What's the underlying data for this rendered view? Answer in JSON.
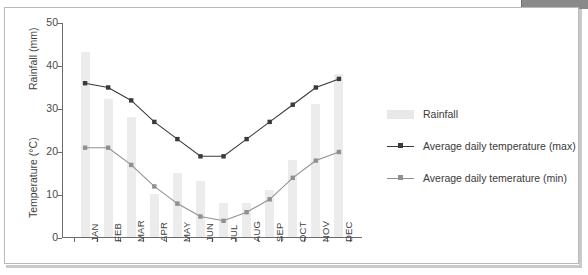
{
  "chart_data": {
    "type": "bar",
    "title": "",
    "subtitle": "",
    "xlabel": "",
    "ylabel": "Rainfall (mm)",
    "ylabel2": "Temperature (°C)",
    "ylim": [
      0,
      50
    ],
    "ytick_values": [
      0,
      10,
      20,
      30,
      40,
      50
    ],
    "ytick_labels": [
      "0",
      "10",
      "20",
      "30",
      "40",
      "50"
    ],
    "grid": false,
    "legend_position": "right",
    "categories": [
      "JAN",
      "FEB",
      "MAR",
      "APR",
      "MAY",
      "JUN",
      "JUL",
      "AUG",
      "SEP",
      "OCT",
      "NOV",
      "DEC"
    ],
    "series": [
      {
        "name": "Rainfall",
        "type": "bar",
        "color": "#ececec",
        "unit": "mm",
        "values": [
          43,
          32,
          28,
          10,
          15,
          13,
          8,
          8,
          11,
          18,
          31,
          38
        ]
      },
      {
        "name": "Average daily temperature (max)",
        "type": "line",
        "color": "#3a3a3a",
        "unit": "°C",
        "values": [
          36,
          35,
          32,
          27,
          23,
          19,
          19,
          23,
          27,
          31,
          35,
          37
        ]
      },
      {
        "name": "Average daily temerature (min)",
        "type": "line",
        "color": "#909090",
        "unit": "°C",
        "values": [
          21,
          21,
          17,
          12,
          8,
          5,
          4,
          6,
          9,
          14,
          18,
          20
        ]
      }
    ]
  },
  "axes": {
    "left_title_top": "Rainfall (mm)",
    "left_title_bottom": "Temperature (°C)"
  },
  "legend": {
    "items": [
      {
        "label": "Rainfall",
        "marker": "box",
        "color": "#e8e8e8"
      },
      {
        "label": "Average daily temperature (max)",
        "marker": "line-dot",
        "color": "#3a3a3a"
      },
      {
        "label": "Average daily temerature (min)",
        "marker": "line-dot",
        "color": "#909090"
      }
    ]
  },
  "colors": {
    "bar": "#ececec",
    "max_line": "#3a3a3a",
    "min_line": "#909090",
    "axis": "#6b6b6b",
    "frame": "#b9b9b9",
    "top_bar": "#8a8a8a"
  }
}
